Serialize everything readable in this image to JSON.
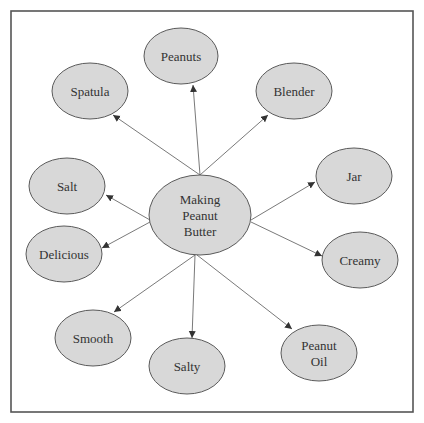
{
  "diagram": {
    "type": "concept-map",
    "center": {
      "id": "center",
      "lines": [
        "Making",
        "Peanut",
        "Butter"
      ],
      "cx": 200,
      "cy": 215,
      "rx": 51,
      "ry": 40
    },
    "nodes": [
      {
        "id": "peanuts",
        "lines": [
          "Peanuts"
        ],
        "cx": 181,
        "cy": 56,
        "rx": 37,
        "ry": 28,
        "from": [
          200,
          175
        ],
        "to": [
          193,
          85
        ]
      },
      {
        "id": "spatula",
        "lines": [
          "Spatula"
        ],
        "cx": 90,
        "cy": 91,
        "rx": 38,
        "ry": 28,
        "from": [
          200,
          175
        ],
        "to": [
          113,
          115
        ]
      },
      {
        "id": "blender",
        "lines": [
          "Blender"
        ],
        "cx": 294,
        "cy": 91,
        "rx": 38,
        "ry": 28,
        "from": [
          200,
          175
        ],
        "to": [
          268,
          115
        ]
      },
      {
        "id": "salt",
        "lines": [
          "Salt"
        ],
        "cx": 67,
        "cy": 186,
        "rx": 38,
        "ry": 28,
        "from": [
          150,
          220
        ],
        "to": [
          106,
          195
        ]
      },
      {
        "id": "delicious",
        "lines": [
          "Delicious"
        ],
        "cx": 64,
        "cy": 254,
        "rx": 38,
        "ry": 28,
        "from": [
          150,
          222
        ],
        "to": [
          102,
          248
        ]
      },
      {
        "id": "jar",
        "lines": [
          "Jar"
        ],
        "cx": 354,
        "cy": 176,
        "rx": 38,
        "ry": 28,
        "from": [
          251,
          220
        ],
        "to": [
          315,
          182
        ]
      },
      {
        "id": "creamy",
        "lines": [
          "Creamy"
        ],
        "cx": 360,
        "cy": 260,
        "rx": 38,
        "ry": 28,
        "from": [
          251,
          222
        ],
        "to": [
          322,
          256
        ]
      },
      {
        "id": "smooth",
        "lines": [
          "Smooth"
        ],
        "cx": 93,
        "cy": 338,
        "rx": 38,
        "ry": 28,
        "from": [
          195,
          255
        ],
        "to": [
          114,
          312
        ]
      },
      {
        "id": "salty",
        "lines": [
          "Salty"
        ],
        "cx": 187,
        "cy": 366,
        "rx": 38,
        "ry": 28,
        "from": [
          195,
          255
        ],
        "to": [
          192,
          338
        ]
      },
      {
        "id": "peanut-oil",
        "lines": [
          "Peanut",
          "Oil"
        ],
        "cx": 319,
        "cy": 353,
        "rx": 38,
        "ry": 28,
        "from": [
          197,
          255
        ],
        "to": [
          292,
          329
        ]
      }
    ],
    "frame": {
      "x": 11,
      "y": 11,
      "width": 402,
      "height": 401
    },
    "colors": {
      "node_fill": "#d8d8d8",
      "node_stroke": "#5a5a5a",
      "text": "#333333",
      "edge": "#6a6a6a",
      "frame": "#555555"
    }
  }
}
